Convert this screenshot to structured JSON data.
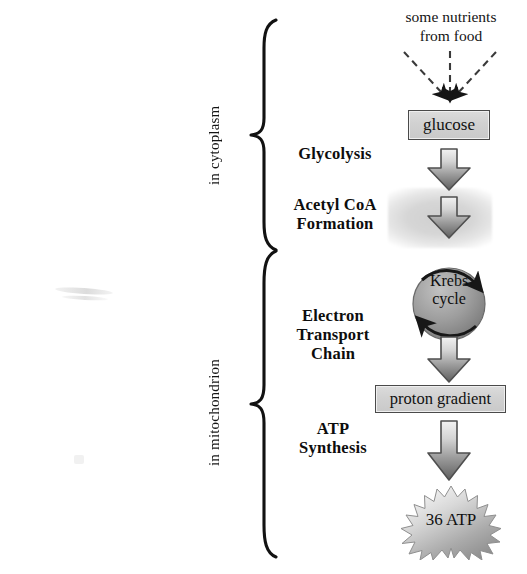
{
  "diagram": {
    "compartments": [
      {
        "id": "cytoplasm",
        "label": "in cytoplasm"
      },
      {
        "id": "mitochondrion",
        "label": "in mitochondrion"
      }
    ],
    "stages": [
      {
        "id": "glycolysis",
        "label": "Glycolysis"
      },
      {
        "id": "acetyl-coa",
        "line1": "Acetyl CoA",
        "line2": "Formation"
      },
      {
        "id": "etc",
        "line1": "Electron",
        "line2": "Transport",
        "line3": "Chain"
      },
      {
        "id": "atp-synth",
        "line1": "ATP",
        "line2": "Synthesis"
      }
    ],
    "flow": {
      "input": {
        "line1": "some nutrients",
        "line2": "from food"
      },
      "glucose_box": "glucose",
      "krebs": {
        "line1": "Krebs",
        "line2": "cycle"
      },
      "proton_box": "proton gradient",
      "yield_burst": "36 ATP"
    },
    "colors": {
      "ink": "#111111",
      "box_fill": "#d2d2d2",
      "box_border": "#4a4a4a",
      "arrow_dark": "#5a5a5a",
      "arrow_light": "#e8e8e8",
      "band_grey": "#d6d6d6",
      "background": "#ffffff"
    }
  }
}
